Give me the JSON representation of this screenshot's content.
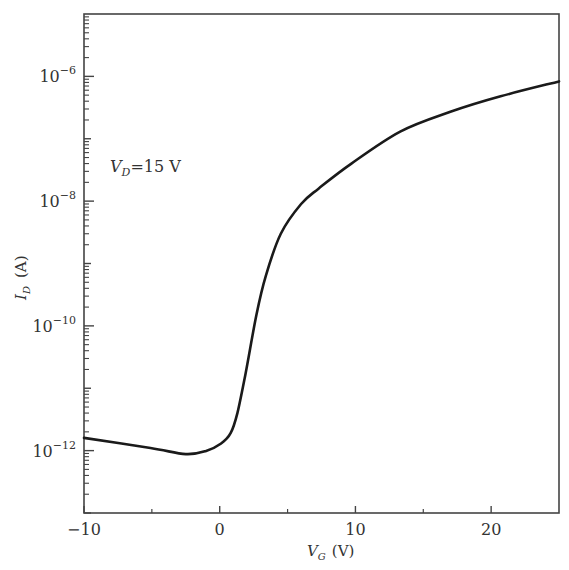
{
  "chart_data": {
    "type": "line",
    "title": "",
    "xlabel": "V_G (V)",
    "xlabel_main": "V",
    "xlabel_sub": "G",
    "xlabel_unit": "(V)",
    "ylabel": "I_D (A)",
    "ylabel_main": "I",
    "ylabel_sub": "D",
    "ylabel_unit": "(A)",
    "xlim": [
      -10,
      25
    ],
    "ylim": [
      1e-13,
      1e-05
    ],
    "yscale": "log",
    "grid": false,
    "legend": null,
    "x_ticks": [
      -10,
      0,
      10,
      20
    ],
    "x_tick_labels": [
      "−10",
      "0",
      "10",
      "20"
    ],
    "x_minor_ticks": [
      -5,
      5,
      15
    ],
    "y_ticks": [
      -12,
      -10,
      -8,
      -6
    ],
    "y_tick_labels": [
      {
        "base": "10",
        "exp": "−12"
      },
      {
        "base": "10",
        "exp": "−10"
      },
      {
        "base": "10",
        "exp": "−8"
      },
      {
        "base": "10",
        "exp": "−6"
      }
    ],
    "annotations": [
      {
        "text": "V_D = 15 V",
        "main": "V",
        "sub": "D",
        "rest": "=15 V",
        "x": -8,
        "y": 1e-07
      }
    ],
    "series": [
      {
        "name": "I_D vs V_G",
        "color": "#1a1a1a",
        "x": [
          -10,
          -5.1,
          -2.5,
          -1.0,
          0.1,
          0.8,
          1.3,
          1.9,
          2.7,
          3.4,
          4.5,
          6.0,
          7.3,
          9.7,
          13.3,
          17.0,
          20.7,
          25.0
        ],
        "y": [
          1.6e-12,
          1.1e-12,
          8.8e-13,
          9.9e-13,
          1.3e-12,
          1.9e-12,
          4e-12,
          1.7e-11,
          1.5e-10,
          6.4e-10,
          3e-09,
          9e-09,
          1.6e-08,
          4e-08,
          1.3e-07,
          2.7e-07,
          4.8e-07,
          8.3e-07
        ]
      }
    ]
  }
}
